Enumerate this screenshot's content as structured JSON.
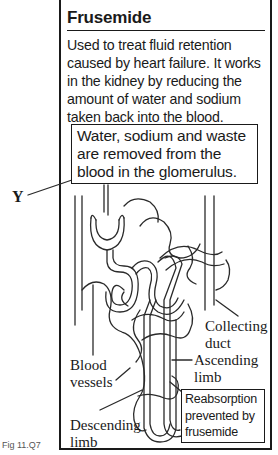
{
  "panel": {
    "title": "Frusemide",
    "description": "Used to treat fluid retention caused by heart failure. It works in the kidney by reducing the amount of water and sodium taken back into the blood.",
    "glomerulus_note": "Water, sodium and waste are removed from the blood in the glomerulus.",
    "reabsorption_note": "Reabsorption prevented by frusemide"
  },
  "labels": {
    "y": "Y",
    "collecting_duct_1": "Collecting",
    "collecting_duct_2": "duct",
    "ascending_limb_1": "Ascending",
    "ascending_limb_2": "limb",
    "blood_vessels_1": "Blood",
    "blood_vessels_2": "vessels",
    "descending_limb_1": "Descending",
    "descending_limb_2": "limb"
  },
  "figure_caption": "Fig 11.Q7"
}
